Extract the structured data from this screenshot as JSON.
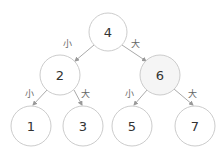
{
  "diagram": {
    "title": "",
    "type": "binary-search-tree",
    "colors": {
      "node_stroke": "#cccccc",
      "node_fill": "#ffffff",
      "node_fill_highlight": "#f5f5f5",
      "edge_stroke": "#aaaaaa",
      "text": "#333333",
      "edge_text": "#666666"
    },
    "nodes": [
      {
        "id": "n4",
        "label": "4",
        "cx": 108,
        "cy": 32,
        "r": 19,
        "highlight": false
      },
      {
        "id": "n2",
        "label": "2",
        "cx": 60,
        "cy": 75,
        "r": 20,
        "highlight": false
      },
      {
        "id": "n6",
        "label": "6",
        "cx": 160,
        "cy": 75,
        "r": 20,
        "highlight": true
      },
      {
        "id": "n1",
        "label": "1",
        "cx": 31,
        "cy": 126,
        "r": 20,
        "highlight": false
      },
      {
        "id": "n3",
        "label": "3",
        "cx": 83,
        "cy": 126,
        "r": 20,
        "highlight": false
      },
      {
        "id": "n5",
        "label": "5",
        "cx": 132,
        "cy": 126,
        "r": 20,
        "highlight": false
      },
      {
        "id": "n7",
        "label": "7",
        "cx": 195,
        "cy": 126,
        "r": 20,
        "highlight": false
      }
    ],
    "edges": [
      {
        "from": "n4",
        "to": "n2",
        "label": "小",
        "x1": 94,
        "y1": 45,
        "x2": 75,
        "y2": 61,
        "lx": 67,
        "ly": 47
      },
      {
        "from": "n4",
        "to": "n6",
        "label": "大",
        "x1": 122,
        "y1": 45,
        "x2": 146,
        "y2": 61,
        "lx": 135,
        "ly": 47
      },
      {
        "from": "n2",
        "to": "n1",
        "label": "小",
        "x1": 47,
        "y1": 90,
        "x2": 33,
        "y2": 105,
        "lx": 29,
        "ly": 97
      },
      {
        "from": "n2",
        "to": "n3",
        "label": "大",
        "x1": 74,
        "y1": 90,
        "x2": 82,
        "y2": 105,
        "lx": 85,
        "ly": 97
      },
      {
        "from": "n6",
        "to": "n5",
        "label": "小",
        "x1": 147,
        "y1": 90,
        "x2": 134,
        "y2": 105,
        "lx": 129,
        "ly": 97
      },
      {
        "from": "n6",
        "to": "n7",
        "label": "大",
        "x1": 174,
        "y1": 89,
        "x2": 193,
        "y2": 105,
        "lx": 192,
        "ly": 97
      }
    ]
  }
}
